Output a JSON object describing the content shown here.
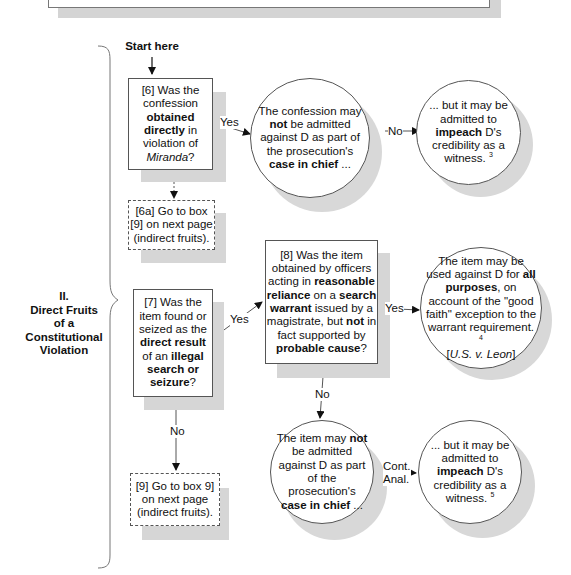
{
  "start_label": "Start here",
  "section": {
    "numeral": "II.",
    "title_lines": [
      "Direct Fruits",
      "of a",
      "Constitutional",
      "Violation"
    ]
  },
  "nodes": {
    "q6": {
      "id": "6",
      "parts": [
        "[6] Was the confession ",
        "obtained directly",
        " in violation of ",
        "Miranda",
        "?"
      ]
    },
    "r6_yes": {
      "parts": [
        "The confession may ",
        "not",
        " be admitted against D as part of the prosecution's ",
        "case in chief",
        " ..."
      ]
    },
    "r6_no": {
      "parts": [
        "... but it may be admitted to ",
        "impeach",
        " D's credibility as a witness.",
        "3"
      ]
    },
    "b6a": {
      "text": "[6a] Go to box [9] on next page (indirect fruits)."
    },
    "q7": {
      "parts": [
        "[7] Was the item found or seized as the ",
        "direct result",
        " of an ",
        "illegal search or seizure",
        "?"
      ]
    },
    "q8": {
      "parts": [
        "[8] Was the item obtained by officers acting in ",
        "reasonable reliance",
        " on a ",
        "search warrant",
        " issued by a magistrate, but ",
        "not",
        " in fact supported by ",
        "probable cause",
        "?"
      ]
    },
    "r8_yes": {
      "parts": [
        "The item may be used against D for ",
        "all purposes",
        ", on account of the \"good faith\" exception to the warrant requirement.",
        "4",
        "[",
        "U.S. v. Leon",
        "]"
      ]
    },
    "b9": {
      "text": "[9] Go to box 9] on next page (indirect fruits)."
    },
    "r8_no": {
      "parts": [
        "The item may ",
        "not",
        " be admitted against D as part of the prosecution's ",
        "case in chief",
        " ..."
      ]
    },
    "r8_no_cont": {
      "parts": [
        "... but it may be admitted to ",
        "impeach",
        " D's credibility as a witness.",
        "5"
      ]
    }
  },
  "edge_labels": {
    "q6_yes": "Yes",
    "r6_no": "No",
    "q7_yes": "Yes",
    "q7_no": "No",
    "q8_yes": "Yes",
    "q8_no": "No",
    "cont_1": "Cont.",
    "cont_2": "Anal."
  }
}
